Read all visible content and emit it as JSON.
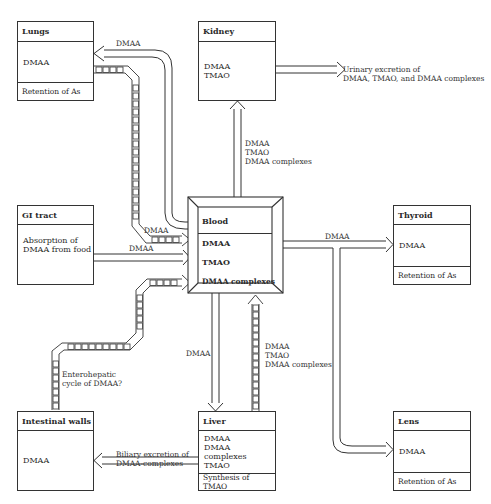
{
  "diagram": {
    "type": "flow-diagram",
    "nodes": {
      "lungs": {
        "title": "Lungs",
        "content": [
          "DMAA"
        ],
        "footer": "Retention of As"
      },
      "kidney": {
        "title": "Kidney",
        "content": [
          "DMAA",
          "TMAO"
        ]
      },
      "gi_tract": {
        "title": "GI tract",
        "content": [
          "Absorption of",
          "DMAA from food"
        ]
      },
      "blood": {
        "title": "Blood",
        "content": [
          "DMAA",
          "TMAO",
          "DMAA complexes"
        ]
      },
      "thyroid": {
        "title": "Thyroid",
        "content": [
          "DMAA"
        ],
        "footer": "Retention of As"
      },
      "intestinal_walls": {
        "title": "Intestinal walls",
        "content": [
          "DMAA"
        ]
      },
      "liver": {
        "title": "Liver",
        "content": [
          "DMAA",
          "DMAA complexes",
          "TMAO"
        ],
        "footer": "Synthesis of TMAO"
      },
      "lens": {
        "title": "Lens",
        "content": [
          "DMAA"
        ],
        "footer": "Retention of As"
      }
    },
    "edges": [
      {
        "from": "blood",
        "to": "lungs",
        "style": "solid",
        "label": [
          "DMAA"
        ]
      },
      {
        "from": "lungs",
        "to": "blood",
        "style": "dashed-blocks",
        "label": [
          "DMAA"
        ]
      },
      {
        "from": "blood",
        "to": "kidney",
        "style": "solid",
        "label": [
          "DMAA",
          "TMAO",
          "DMAA complexes"
        ]
      },
      {
        "from": "kidney",
        "to": "urine",
        "style": "solid",
        "label": [
          "Urinary excretion of",
          "DMAA, TMAO, and DMAA complexes"
        ]
      },
      {
        "from": "gi_tract",
        "to": "blood",
        "style": "solid",
        "label": [
          "DMAA"
        ]
      },
      {
        "from": "blood",
        "to": "thyroid",
        "style": "solid",
        "label": [
          "DMAA"
        ]
      },
      {
        "from": "blood",
        "to": "lens",
        "style": "solid",
        "label": []
      },
      {
        "from": "blood",
        "to": "liver",
        "style": "solid",
        "label": [
          "DMAA"
        ]
      },
      {
        "from": "liver",
        "to": "blood",
        "style": "dashed-blocks",
        "label": [
          "DMAA",
          "TMAO",
          "DMAA complexes"
        ]
      },
      {
        "from": "liver",
        "to": "intestinal_walls",
        "style": "solid",
        "label": [
          "Biliary excretion of",
          "DMAA-complexes"
        ]
      },
      {
        "from": "intestinal_walls",
        "to": "blood",
        "style": "dashed-blocks",
        "label": [
          "Enterohepatic",
          "cycle of DMAA?"
        ]
      }
    ]
  },
  "labels": {
    "lungs_out": "DMAA",
    "lungs_in": "DMAA",
    "gi_in": "DMAA",
    "thyroid_out": "DMAA",
    "kidney_in": [
      "DMAA",
      "TMAO",
      "DMAA complexes"
    ],
    "urinary": [
      "Urinary excretion of",
      "DMAA, TMAO, and DMAA complexes"
    ],
    "liver_down": "DMAA",
    "liver_up": [
      "DMAA",
      "TMAO",
      "DMAA complexes"
    ],
    "biliary": [
      "Biliary excretion of",
      "DMAA-complexes"
    ],
    "enterohepatic": [
      "Enterohepatic",
      "cycle of DMAA?"
    ]
  }
}
